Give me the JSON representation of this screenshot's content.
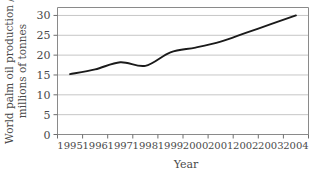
{
  "chart_data": {
    "type": "line",
    "title": "",
    "xlabel": "Year",
    "ylabel": "World palm oil production / millions of tonnes",
    "ylabel_line1": "World palm oil production /",
    "ylabel_line2": "millions of tonnes",
    "x": [
      1995,
      1996,
      1997,
      1998,
      1999,
      2000,
      2001,
      2002,
      2003,
      2004
    ],
    "categories": [
      "1995",
      "1996",
      "1997",
      "1998",
      "1999",
      "2000",
      "2001",
      "2002",
      "2003",
      "2004"
    ],
    "values": [
      15.2,
      16.4,
      18.2,
      17.3,
      20.7,
      21.9,
      23.4,
      25.6,
      27.8,
      30.0
    ],
    "series": [
      {
        "name": "World palm oil production",
        "values": [
          15.2,
          16.4,
          18.2,
          17.3,
          20.7,
          21.9,
          23.4,
          25.6,
          27.8,
          30.0
        ]
      }
    ],
    "ylim": [
      0,
      32
    ],
    "xlim": [
      1994.5,
      2004.5
    ],
    "yticks": [
      0,
      5,
      10,
      15,
      20,
      25,
      30
    ],
    "ytick_labels": [
      "0",
      "5",
      "10",
      "15",
      "20",
      "25",
      "30"
    ],
    "grid": true,
    "grid_axis": "y",
    "legend": false,
    "legend_position": "none",
    "line_color": "#1a1a1a",
    "grid_color": "#b8b8b8",
    "frame_color": "#8a8a8a",
    "background_color": "#ffffff"
  },
  "axes": {
    "x_title": "Year",
    "y_title_line1": "World palm oil production /",
    "y_title_line2": "millions of tonnes"
  }
}
